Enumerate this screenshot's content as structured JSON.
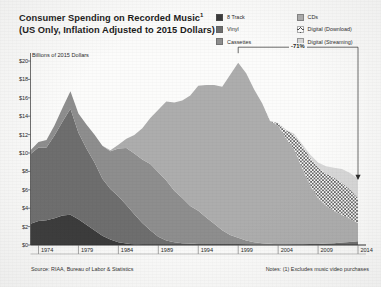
{
  "title": {
    "line1": "Consumer Spending on Recorded Music",
    "line1_sup": "1",
    "line2": "(US Only, Inflation Adjusted to 2015 Dollars)"
  },
  "legend": {
    "columns": [
      {
        "items": [
          {
            "label": "8 Track",
            "color": "#3a3a3a",
            "pattern": "solid"
          },
          {
            "label": "Vinyl",
            "color": "#6e6e6e",
            "pattern": "solid"
          },
          {
            "label": "Cassettes",
            "color": "#8e8e8e",
            "pattern": "solid"
          }
        ]
      },
      {
        "items": [
          {
            "label": "CDs",
            "color": "#adadad",
            "pattern": "solid"
          },
          {
            "label": "Digital (Download)",
            "color": "#ffffff",
            "pattern": "hatch"
          },
          {
            "label": "Digital (Streaming)",
            "color": "#d8d8d8",
            "pattern": "solid"
          }
        ]
      }
    ]
  },
  "annotation": {
    "percent_label": "-71%",
    "from_year": 1999,
    "to_year": 2014,
    "bracket_top_value": 21.5,
    "arrow_value": 7.2
  },
  "footer": {
    "source": "Source: RIAA, Bureau of Labor & Statistics",
    "notes": "Notes: (1) Excludes music video purchases"
  },
  "chart_data": {
    "type": "area",
    "stacked": true,
    "xlabel": "",
    "ylabel": "Billions of 2015 Dollars",
    "ylim": [
      0,
      20
    ],
    "xlim": [
      1973,
      2015
    ],
    "grid": false,
    "legend_position": "top-right",
    "ytick_labels": [
      "$0",
      "$2",
      "$4",
      "$6",
      "$8",
      "$10",
      "$12",
      "$14",
      "$16",
      "$18",
      "$20"
    ],
    "ytick_values": [
      0,
      2,
      4,
      6,
      8,
      10,
      12,
      14,
      16,
      18,
      20
    ],
    "xtick_labels": [
      "1974",
      "1979",
      "1984",
      "1989",
      "1994",
      "1999",
      "2004",
      "2009",
      "2014"
    ],
    "xtick_values": [
      1974,
      1979,
      1984,
      1989,
      1994,
      1999,
      2004,
      2009,
      2014
    ],
    "x": [
      1973,
      1974,
      1975,
      1976,
      1977,
      1978,
      1979,
      1980,
      1981,
      1982,
      1983,
      1984,
      1985,
      1986,
      1987,
      1988,
      1989,
      1990,
      1991,
      1992,
      1993,
      1994,
      1995,
      1996,
      1997,
      1998,
      1999,
      2000,
      2001,
      2002,
      2003,
      2004,
      2005,
      2006,
      2007,
      2008,
      2009,
      2010,
      2011,
      2012,
      2013,
      2014
    ],
    "series": [
      {
        "name": "8 Track",
        "color": "#3a3a3a",
        "pattern": "solid",
        "values": [
          2.3,
          2.6,
          2.7,
          2.9,
          3.2,
          3.3,
          2.8,
          2.2,
          1.6,
          1.0,
          0.6,
          0.3,
          0.15,
          0.05,
          0.0,
          0.0,
          0.0,
          0.0,
          0.0,
          0.0,
          0.0,
          0.0,
          0.0,
          0.0,
          0.0,
          0.0,
          0.0,
          0.0,
          0.0,
          0.0,
          0.0,
          0.0,
          0.0,
          0.0,
          0.0,
          0.0,
          0.0,
          0.0,
          0.0,
          0.0,
          0.0,
          0.0
        ]
      },
      {
        "name": "Vinyl",
        "color": "#6e6e6e",
        "pattern": "solid",
        "values": [
          7.6,
          8.0,
          7.9,
          9.0,
          10.2,
          11.5,
          9.4,
          8.3,
          7.4,
          6.2,
          5.5,
          5.0,
          4.2,
          3.3,
          2.4,
          1.6,
          0.9,
          0.5,
          0.3,
          0.2,
          0.15,
          0.12,
          0.1,
          0.1,
          0.1,
          0.1,
          0.1,
          0.08,
          0.06,
          0.05,
          0.05,
          0.05,
          0.06,
          0.07,
          0.08,
          0.1,
          0.12,
          0.16,
          0.2,
          0.26,
          0.33,
          0.4
        ]
      },
      {
        "name": "Cassettes",
        "color": "#8e8e8e",
        "pattern": "solid",
        "values": [
          0.4,
          0.6,
          0.8,
          1.1,
          1.5,
          1.9,
          2.1,
          2.6,
          3.0,
          3.6,
          4.1,
          5.2,
          6.2,
          6.6,
          6.9,
          7.2,
          7.0,
          6.5,
          5.6,
          4.9,
          4.1,
          3.6,
          2.9,
          2.2,
          1.5,
          1.0,
          0.7,
          0.4,
          0.25,
          0.15,
          0.08,
          0.04,
          0.02,
          0.01,
          0.0,
          0.0,
          0.0,
          0.0,
          0.0,
          0.0,
          0.0,
          0.0
        ]
      },
      {
        "name": "CDs",
        "color": "#adadad",
        "pattern": "solid",
        "values": [
          0.0,
          0.0,
          0.0,
          0.0,
          0.0,
          0.0,
          0.0,
          0.0,
          0.0,
          0.0,
          0.1,
          0.4,
          1.0,
          2.0,
          3.4,
          5.0,
          6.8,
          8.6,
          9.6,
          10.6,
          12.0,
          13.6,
          14.4,
          15.1,
          15.6,
          17.4,
          19.0,
          18.2,
          16.6,
          15.2,
          13.3,
          12.9,
          11.5,
          10.3,
          8.3,
          6.4,
          5.0,
          4.1,
          3.5,
          3.0,
          2.5,
          2.0
        ]
      },
      {
        "name": "Digital (Download)",
        "color": "#ffffff",
        "pattern": "hatch",
        "values": [
          0.0,
          0.0,
          0.0,
          0.0,
          0.0,
          0.0,
          0.0,
          0.0,
          0.0,
          0.0,
          0.0,
          0.0,
          0.0,
          0.0,
          0.0,
          0.0,
          0.0,
          0.0,
          0.0,
          0.0,
          0.0,
          0.0,
          0.0,
          0.0,
          0.0,
          0.0,
          0.0,
          0.0,
          0.0,
          0.0,
          0.05,
          0.25,
          0.9,
          1.6,
          2.4,
          3.0,
          3.3,
          3.5,
          3.6,
          3.5,
          3.2,
          2.7
        ]
      },
      {
        "name": "Digital (Streaming)",
        "color": "#d8d8d8",
        "pattern": "solid",
        "values": [
          0.0,
          0.0,
          0.0,
          0.0,
          0.0,
          0.0,
          0.0,
          0.0,
          0.0,
          0.0,
          0.0,
          0.0,
          0.0,
          0.0,
          0.0,
          0.0,
          0.0,
          0.0,
          0.0,
          0.0,
          0.0,
          0.0,
          0.0,
          0.0,
          0.0,
          0.0,
          0.0,
          0.0,
          0.0,
          0.0,
          0.0,
          0.02,
          0.05,
          0.1,
          0.2,
          0.35,
          0.55,
          0.8,
          1.1,
          1.5,
          1.8,
          2.1
        ]
      }
    ]
  }
}
